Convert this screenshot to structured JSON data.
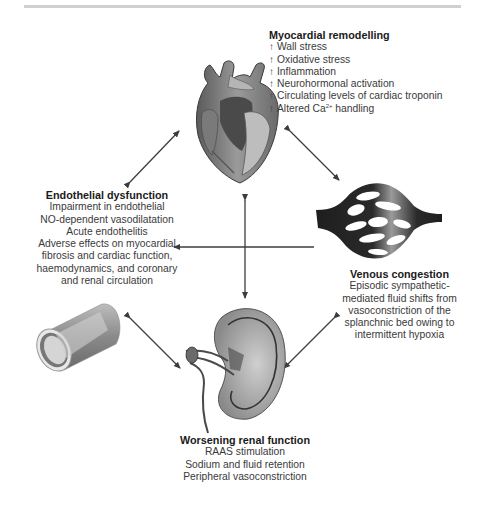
{
  "diagram": {
    "nodes": {
      "myocardial": {
        "title": "Myocardial remodelling",
        "items": [
          {
            "prefix": "↑",
            "text": "Wall stress"
          },
          {
            "prefix": "↑",
            "text": "Oxidative stress"
          },
          {
            "prefix": "↑",
            "text": "Inflammation"
          },
          {
            "prefix": "↑",
            "text": "Neurohormonal activation"
          },
          {
            "prefix": "↑",
            "text": "Circulating levels of cardiac troponin"
          },
          {
            "prefix": "↑",
            "text": "Altered Ca",
            "sup": "2+",
            "suffix": " handling"
          }
        ],
        "icon": "heart-illustration"
      },
      "endothelial": {
        "title": "Endothelial dysfunction",
        "items": [
          "Impairment in endothelial",
          "NO-dependent vasodilatation",
          "Acute endothelitis",
          "Adverse effects on myocardial",
          "fibrosis and cardiac function,",
          "haemodynamics, and coronary",
          "and renal circulation"
        ],
        "icon": "blood-vessel-illustration"
      },
      "venous": {
        "title": "Venous congestion",
        "items": [
          "Episodic sympathetic-",
          "mediated fluid shifts from",
          "vasoconstriction of the",
          "splanchnic bed owing to",
          "intermittent hypoxia"
        ],
        "icon": "venous-network-illustration"
      },
      "renal": {
        "title": "Worsening renal function",
        "items": [
          "RAAS stimulation",
          "Sodium and fluid retention",
          "Peripheral vasoconstriction"
        ],
        "icon": "kidney-illustration"
      }
    },
    "edges": [
      {
        "from": "endothelial",
        "to": "myocardial",
        "type": "bidirectional"
      },
      {
        "from": "myocardial",
        "to": "venous",
        "type": "bidirectional"
      },
      {
        "from": "endothelial",
        "to": "renal",
        "type": "bidirectional"
      },
      {
        "from": "venous",
        "to": "renal",
        "type": "bidirectional"
      },
      {
        "from": "myocardial",
        "to": "renal",
        "type": "bidirectional"
      },
      {
        "from": "center",
        "to": "endothelial",
        "type": "arrow"
      }
    ],
    "colors": {
      "arrow": "#3c3c3c",
      "text": "#3a3a3a",
      "title": "#1a1a1a",
      "rule": "#cfcfcf"
    }
  }
}
